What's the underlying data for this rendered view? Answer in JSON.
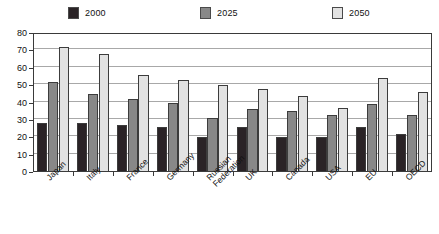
{
  "chart_data": {
    "type": "bar",
    "title": "",
    "subtitle": "",
    "xlabel": "",
    "ylabel": "",
    "ylim": [
      0,
      80
    ],
    "ytick_step": 10,
    "yticks": [
      0,
      10,
      20,
      30,
      40,
      50,
      60,
      70,
      80
    ],
    "grid": true,
    "legend_position": "top",
    "orientation": "vertical",
    "categories": [
      "Japan",
      "Italy",
      "France",
      "Germany",
      "Russian\nFederation",
      "UK",
      "Canada",
      "USA",
      "EU",
      "OECD"
    ],
    "series": [
      {
        "name": "2000",
        "color": "#2a2326",
        "values": [
          28,
          28,
          27,
          26,
          20,
          26,
          20,
          20,
          26,
          22
        ]
      },
      {
        "name": "2025",
        "color": "#888888",
        "values": [
          52,
          45,
          42,
          40,
          31,
          36,
          35,
          33,
          39,
          33
        ]
      },
      {
        "name": "2050",
        "color": "#e2e2e2",
        "values": [
          72,
          68,
          56,
          53,
          50,
          48,
          44,
          37,
          54,
          46
        ]
      }
    ]
  },
  "legend": {
    "items": [
      {
        "label": "2000",
        "color": "#2a2326"
      },
      {
        "label": "2025",
        "color": "#888888"
      },
      {
        "label": "2050",
        "color": "#e2e2e2"
      }
    ]
  },
  "axis": {
    "y_labels": [
      "80",
      "70",
      "60",
      "50",
      "40",
      "30",
      "20",
      "10",
      "0"
    ]
  }
}
